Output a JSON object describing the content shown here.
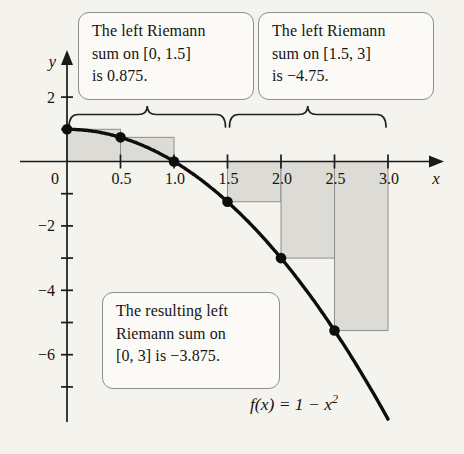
{
  "figure": {
    "callouts": [
      {
        "lines": [
          "The left Riemann",
          "sum on [0, 1.5]",
          "is 0.875."
        ]
      },
      {
        "lines": [
          "The left Riemann",
          "sum on [1.5, 3]",
          "is −4.75."
        ]
      },
      {
        "lines": [
          "The resulting left",
          "Riemann sum on",
          "[0, 3] is −3.875."
        ]
      }
    ],
    "function_label": {
      "base": "f(x) = 1 − x",
      "exponent": "2"
    }
  },
  "chart_data": {
    "type": "line",
    "function": "f(x) = 1 − x²",
    "xlabel": "x",
    "ylabel": "y",
    "origin_label": "0",
    "xlim": [
      -0.4,
      3.55
    ],
    "ylim": [
      -8.4,
      3.3
    ],
    "x_ticks": [
      {
        "v": 0.5,
        "label": "0.5"
      },
      {
        "v": 1.0,
        "label": "1.0"
      },
      {
        "v": 1.5,
        "label": "1.5"
      },
      {
        "v": 2.0,
        "label": "2.0"
      },
      {
        "v": 2.5,
        "label": "2.5"
      },
      {
        "v": 3.0,
        "label": "3.0"
      }
    ],
    "y_ticks_labeled": [
      {
        "v": 2,
        "label": "2"
      },
      {
        "v": -2,
        "label": "−2"
      },
      {
        "v": -4,
        "label": "−4"
      },
      {
        "v": -6,
        "label": "−6"
      }
    ],
    "y_ticks_minor": [
      1,
      -1,
      -3,
      -5,
      -7
    ],
    "curve": {
      "expr": "1 - x^2",
      "domain": [
        0,
        3.0
      ]
    },
    "points": [
      {
        "x": 0,
        "y": 1
      },
      {
        "x": 0.5,
        "y": 0.75
      },
      {
        "x": 1,
        "y": 0
      },
      {
        "x": 1.5,
        "y": -1.25
      },
      {
        "x": 2,
        "y": -3
      },
      {
        "x": 2.5,
        "y": -5.25
      }
    ],
    "rectangles": [
      {
        "x0": 0,
        "x1": 0.5,
        "height": 1
      },
      {
        "x0": 0.5,
        "x1": 1,
        "height": 0.75
      },
      {
        "x0": 1,
        "x1": 1.5,
        "height": 0
      },
      {
        "x0": 1.5,
        "x1": 2,
        "height": -1.25
      },
      {
        "x0": 2,
        "x1": 2.5,
        "height": -3
      },
      {
        "x0": 2.5,
        "x1": 3,
        "height": -5.25
      }
    ],
    "braces": [
      {
        "x0": 0,
        "x1": 1.5
      },
      {
        "x0": 1.5,
        "x1": 3
      }
    ],
    "riemann_sums": {
      "left_on_0_to_1_5": 0.875,
      "left_on_1_5_to_3": -4.75,
      "resulting_left_on_0_to_3": -3.875
    },
    "colors": {
      "rect_fill": "#dcdbd5",
      "rect_stroke": "#8e8e8a",
      "curve": "#0d0d0d",
      "axis": "#1a1a1a",
      "text": "#141414",
      "background": "#f4f3ed"
    }
  }
}
